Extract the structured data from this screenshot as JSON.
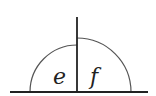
{
  "diagram": {
    "labels": {
      "left_region": "e",
      "right_region": "f"
    },
    "colors": {
      "line": "#222222",
      "arc": "#555555",
      "background": "#ffffff"
    }
  }
}
